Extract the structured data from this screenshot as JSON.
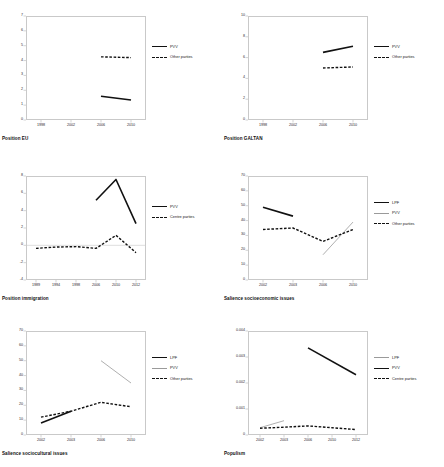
{
  "figure": {
    "panel_count": 6
  },
  "chart_data": [
    {
      "id": "position-eu",
      "type": "line",
      "title": "Position EU",
      "xlabel": "",
      "ylabel": "",
      "x": [
        1998,
        2002,
        2006,
        2010
      ],
      "xticklabels": [
        "1998",
        "2002",
        "2006",
        "2010"
      ],
      "ylim": [
        0,
        7
      ],
      "yticks": [
        0,
        1,
        2,
        3,
        4,
        5,
        6,
        7
      ],
      "grid": false,
      "legend_position": "right",
      "series": [
        {
          "name": "PVV",
          "style": "solid-thick",
          "color": "#111111",
          "x": [
            2006,
            2010
          ],
          "values": [
            1.6,
            1.35
          ]
        },
        {
          "name": "Other parties",
          "style": "dashed",
          "color": "#111111",
          "x": [
            2006,
            2010
          ],
          "values": [
            4.25,
            4.2
          ]
        }
      ]
    },
    {
      "id": "position-galtan",
      "type": "line",
      "title": "Position GALTAN",
      "xlabel": "",
      "ylabel": "",
      "x": [
        1998,
        2002,
        2006,
        2010
      ],
      "xticklabels": [
        "1998",
        "2002",
        "2006",
        "2010"
      ],
      "ylim": [
        0,
        10
      ],
      "yticks": [
        0,
        2,
        4,
        6,
        8,
        10
      ],
      "grid": false,
      "legend_position": "right",
      "series": [
        {
          "name": "PVV",
          "style": "solid-thick",
          "color": "#111111",
          "x": [
            2006,
            2010
          ],
          "values": [
            6.5,
            7.1
          ]
        },
        {
          "name": "Other parties",
          "style": "dashed",
          "color": "#111111",
          "x": [
            2006,
            2010
          ],
          "values": [
            5.0,
            5.1
          ]
        }
      ]
    },
    {
      "id": "position-immigration",
      "type": "line",
      "title": "Position immigration",
      "xlabel": "",
      "ylabel": "",
      "x": [
        1989,
        1994,
        1998,
        2006,
        2010,
        2012
      ],
      "xticklabels": [
        "1989",
        "1994",
        "1998",
        "2006",
        "2010",
        "2012"
      ],
      "ylim": [
        -4,
        8
      ],
      "yticks": [
        -4,
        -2,
        0,
        2,
        4,
        6,
        8
      ],
      "grid": false,
      "legend_position": "right",
      "series": [
        {
          "name": "PVV",
          "style": "solid-thick",
          "color": "#111111",
          "x": [
            2006,
            2010,
            2012
          ],
          "values": [
            5.2,
            7.6,
            2.5
          ]
        },
        {
          "name": "Centre parties",
          "style": "dashed",
          "color": "#111111",
          "x": [
            1989,
            1994,
            1998,
            2006,
            2010,
            2012
          ],
          "values": [
            -0.35,
            -0.2,
            -0.15,
            -0.35,
            1.15,
            -0.85
          ]
        }
      ]
    },
    {
      "id": "salience-socioeconomic-issues",
      "type": "line",
      "title": "Salience socioeconomic issues",
      "xlabel": "",
      "ylabel": "",
      "x": [
        2002,
        2003,
        2006,
        2010
      ],
      "xticklabels": [
        "2002",
        "2003",
        "2006",
        "2010"
      ],
      "ylim": [
        0,
        70
      ],
      "yticks": [
        0,
        10,
        20,
        30,
        40,
        50,
        60,
        70
      ],
      "grid": false,
      "legend_position": "right",
      "series": [
        {
          "name": "LPF",
          "style": "solid-thick",
          "color": "#111111",
          "x": [
            2002,
            2003
          ],
          "values": [
            49,
            43
          ]
        },
        {
          "name": "PVV",
          "style": "solid-thin",
          "color": "#9a9a9a",
          "x": [
            2006,
            2010
          ],
          "values": [
            17,
            39
          ]
        },
        {
          "name": "Other parties",
          "style": "dashed",
          "color": "#111111",
          "x": [
            2002,
            2003,
            2006,
            2010
          ],
          "values": [
            34,
            35,
            26,
            34
          ]
        }
      ]
    },
    {
      "id": "salience-sociocultural-issues",
      "type": "line",
      "title": "Salience sociocultural issues",
      "xlabel": "",
      "ylabel": "",
      "x": [
        2002,
        2003,
        2006,
        2010
      ],
      "xticklabels": [
        "2002",
        "2003",
        "2006",
        "2010"
      ],
      "ylim": [
        0,
        70
      ],
      "yticks": [
        0,
        10,
        20,
        30,
        40,
        50,
        60,
        70
      ],
      "grid": false,
      "legend_position": "right",
      "series": [
        {
          "name": "LPF",
          "style": "solid-thick",
          "color": "#111111",
          "x": [
            2002,
            2003
          ],
          "values": [
            8,
            16
          ]
        },
        {
          "name": "PVV",
          "style": "solid-thin",
          "color": "#9a9a9a",
          "x": [
            2006,
            2010
          ],
          "values": [
            50,
            35
          ]
        },
        {
          "name": "Other parties",
          "style": "dashed",
          "color": "#111111",
          "x": [
            2002,
            2003,
            2006,
            2010
          ],
          "values": [
            12,
            16,
            22,
            19
          ]
        }
      ]
    },
    {
      "id": "populism",
      "type": "line",
      "title": "Populism",
      "xlabel": "",
      "ylabel": "",
      "x": [
        2002,
        2003,
        2006,
        2010,
        2012
      ],
      "xticklabels": [
        "2002",
        "2003",
        "2006",
        "2010",
        "2012"
      ],
      "ylim": [
        0,
        0.004
      ],
      "yticks": [
        0,
        0.001,
        0.002,
        0.003,
        0.004
      ],
      "yticklabels": [
        "0",
        "0.001",
        "0.002",
        "0.003",
        "0.004"
      ],
      "grid": false,
      "legend_position": "right",
      "series": [
        {
          "name": "LPF",
          "style": "solid-thin",
          "color": "#9a9a9a",
          "x": [
            2002,
            2003
          ],
          "values": [
            0.00028,
            0.00055
          ]
        },
        {
          "name": "PVV",
          "style": "solid-thick",
          "color": "#111111",
          "x": [
            2006,
            2012
          ],
          "values": [
            0.00335,
            0.00232
          ]
        },
        {
          "name": "Centre parties",
          "style": "dashed",
          "color": "#111111",
          "x": [
            2002,
            2003,
            2006,
            2010,
            2012
          ],
          "values": [
            0.00026,
            0.0003,
            0.00035,
            0.00028,
            0.00021
          ]
        }
      ]
    }
  ]
}
